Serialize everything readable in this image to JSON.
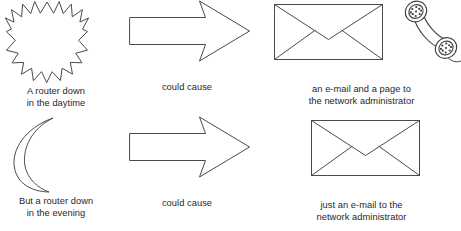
{
  "diagram": {
    "background_color": "#ffffff",
    "stroke_color": "#4a4a4a",
    "text_color": "#1f1f1f",
    "rows": [
      {
        "id": "daytime-scenario",
        "cause": {
          "icon": "starburst-sun-icon",
          "caption": "A router down\nin the daytime"
        },
        "connector": {
          "icon": "right-block-arrow-icon",
          "caption": "could cause"
        },
        "effect": {
          "icons": [
            "envelope-icon",
            "telephone-handset-icon"
          ],
          "caption": "an e-mail and a page to\nthe network administrator"
        }
      },
      {
        "id": "evening-scenario",
        "cause": {
          "icon": "crescent-moon-icon",
          "caption": "But a router down\nin the evening"
        },
        "connector": {
          "icon": "right-block-arrow-icon",
          "caption": "could cause"
        },
        "effect": {
          "icons": [
            "envelope-icon"
          ],
          "caption": "just an e-mail to the\nnetwork administrator"
        }
      }
    ]
  }
}
